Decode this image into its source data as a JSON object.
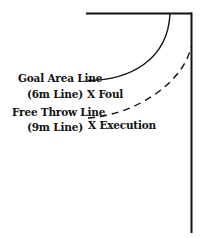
{
  "diagram": {
    "labels": {
      "goal_area_line": "Goal Area Line",
      "goal_area_sub": "(6m Line)",
      "foul_marker": "X Foul",
      "free_throw_line": "Free Throw Line",
      "free_throw_sub": "(9m Line)",
      "execution_marker": "X Execution"
    },
    "colors": {
      "line": "#111111",
      "background": "#ffffff"
    }
  }
}
